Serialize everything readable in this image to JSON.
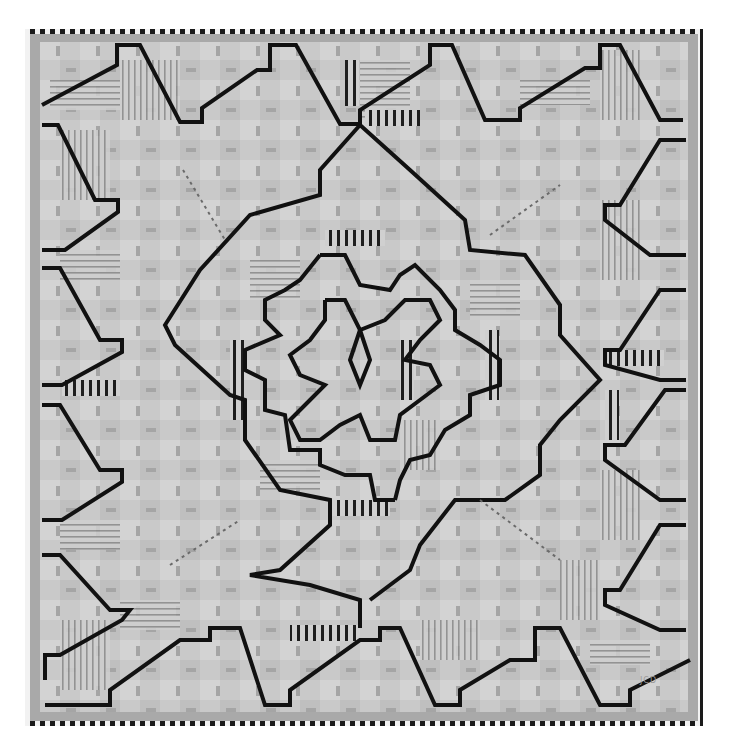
{
  "image": {
    "subject": "Geometric art quilt photographed flat on white background",
    "description": "Grayscale quilt made of light gray strip-pieced blocks with pale striped fabrics, overlaid by thick black zigzag/stepped lines forming concentric radiating diamond and pinwheel shapes around a central spiral. Outer edge finished with a black-and-white checkered binding and a medium gray inner border.",
    "colors": {
      "background": "#ffffff",
      "quilt_base": "#c8c8c8",
      "block_light": "#d6d6d6",
      "block_mid": "#b8b8b8",
      "inner_border": "#a9a9a9",
      "accent_lines": "#111111",
      "binding_dark": "#1a1a1a",
      "binding_light": "#f2f2f2"
    },
    "signature_label": "JCD"
  }
}
